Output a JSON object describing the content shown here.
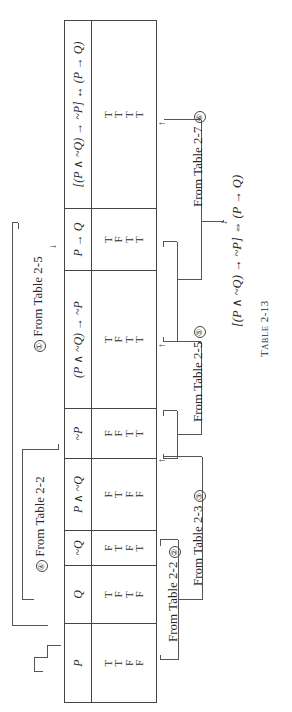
{
  "table": {
    "caption_prefix": "T",
    "caption_smallcaps": "ABLE",
    "caption_number": "2-13",
    "columns": [
      {
        "header": "P",
        "values": [
          "T",
          "T",
          "F",
          "F"
        ]
      },
      {
        "header": "Q",
        "values": [
          "T",
          "F",
          "T",
          "F"
        ]
      },
      {
        "header": "~Q",
        "values": [
          "F",
          "T",
          "F",
          "T"
        ]
      },
      {
        "header": "P ∧ ~Q",
        "values": [
          "F",
          "T",
          "F",
          "F"
        ]
      },
      {
        "header": "~P",
        "values": [
          "F",
          "F",
          "T",
          "T"
        ]
      },
      {
        "header": "(P ∧ ~Q) → ~P",
        "values": [
          "T",
          "F",
          "T",
          "T"
        ]
      },
      {
        "header": "P → Q",
        "values": [
          "T",
          "F",
          "T",
          "T"
        ]
      },
      {
        "header": "[(P ∧ ~Q) → ~P] ↔ (P → Q)",
        "values": [
          "T",
          "T",
          "T",
          "T"
        ]
      }
    ]
  },
  "annotations": {
    "top": [
      {
        "step": "④",
        "label": "From Table 2-2"
      },
      {
        "step": "①",
        "label": "From Table 2-5"
      }
    ],
    "bottom": [
      {
        "step": "②",
        "label": "From Table 2-2"
      },
      {
        "step": "③",
        "label": "From Table 2-3"
      },
      {
        "step": "⑤",
        "label": "From Table 2-5"
      },
      {
        "step": "⑥",
        "label": "From Table 2-7"
      }
    ]
  },
  "conclusion": "[(P ∧ ~Q) → ~P] ⇔ (P → Q)"
}
